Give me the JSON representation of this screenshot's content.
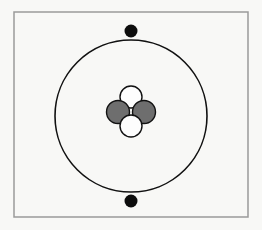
{
  "figure": {
    "canvas": {
      "width": 262,
      "height": 230
    },
    "background_color": "#f8f8f6"
  },
  "frame": {
    "name": "diagram-border",
    "x": 14,
    "y": 12,
    "width": 234,
    "height": 205,
    "stroke_color": "#9a9a9a",
    "stroke_width": 1.5,
    "fill": "none"
  },
  "orbit": {
    "name": "electron-shell",
    "center_x": 131,
    "center_y": 116,
    "radius": 76,
    "stroke_color": "#111111",
    "stroke_width": 1.6,
    "fill": "none"
  },
  "electrons": [
    {
      "label": "electron-top",
      "position": "top",
      "cx": 131,
      "cy": 31,
      "r": 6.5,
      "color": "#0d0d0d"
    },
    {
      "label": "electron-bottom",
      "position": "bottom",
      "cx": 131,
      "cy": 201,
      "r": 6.5,
      "color": "#0d0d0d"
    }
  ],
  "nucleus": {
    "name": "atomic-nucleus",
    "center_x": 131,
    "center_y": 110,
    "particles": [
      {
        "label": "neutron-top",
        "type": "neutron",
        "cx": 131,
        "cy": 97,
        "r": 11,
        "fill_color": "#fdfdfd",
        "stroke_color": "#111111"
      },
      {
        "label": "proton-left",
        "type": "proton",
        "cx": 118,
        "cy": 112,
        "r": 11.5,
        "fill_color": "#6e6e6e",
        "stroke_color": "#111111"
      },
      {
        "label": "proton-right",
        "type": "proton",
        "cx": 144,
        "cy": 112,
        "r": 11.5,
        "fill_color": "#6e6e6e",
        "stroke_color": "#111111"
      },
      {
        "label": "neutron-bottom",
        "type": "neutron",
        "cx": 131,
        "cy": 126,
        "r": 11,
        "fill_color": "#fdfdfd",
        "stroke_color": "#111111"
      }
    ],
    "proton_count": 2,
    "neutron_count": 2
  },
  "colors": {
    "background": "#f8f8f6",
    "frame_stroke": "#9a9a9a",
    "orbit_stroke": "#111111",
    "electron_fill": "#0d0d0d",
    "proton_fill": "#6e6e6e",
    "neutron_fill": "#fdfdfd",
    "particle_stroke": "#111111"
  }
}
